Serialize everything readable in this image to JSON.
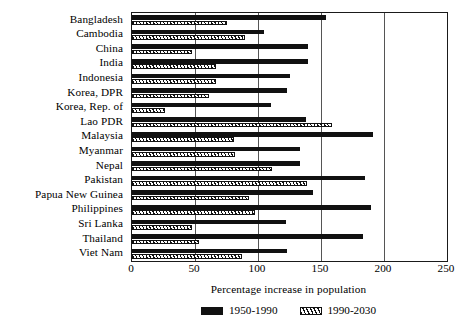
{
  "chart_data": {
    "type": "bar",
    "orientation": "horizontal",
    "title": "",
    "xlabel": "Percentage increase in population",
    "ylabel": "",
    "xlim": [
      0,
      250
    ],
    "xticks": [
      0,
      50,
      100,
      150,
      200,
      250
    ],
    "grid": true,
    "legend_position": "bottom",
    "categories": [
      "Bangladesh",
      "Cambodia",
      "China",
      "India",
      "Indonesia",
      "Korea, DPR",
      "Korea, Rep. of",
      "Lao PDR",
      "Malaysia",
      "Myanmar",
      "Nepal",
      "Pakistan",
      "Papua New Guinea",
      "Philippines",
      "Sri Lanka",
      "Thailand",
      "Viet Nam"
    ],
    "series": [
      {
        "name": "1950-1990",
        "style": "solid-black",
        "color": "#111111",
        "values": [
          154,
          105,
          140,
          140,
          125,
          123,
          110,
          138,
          191,
          133,
          133,
          185,
          144,
          190,
          122,
          183,
          123
        ]
      },
      {
        "name": "1990-2030",
        "style": "hatched",
        "color": "#111111",
        "values": [
          75,
          90,
          48,
          67,
          67,
          61,
          26,
          159,
          81,
          82,
          111,
          139,
          93,
          98,
          48,
          53,
          87
        ]
      }
    ]
  },
  "axis": {
    "tick_labels": [
      "0",
      "50",
      "100",
      "150",
      "200",
      "250"
    ],
    "title": "Percentage increase in population"
  },
  "legend": {
    "items": [
      {
        "label": "1950-1990",
        "swatch": "solid-black-swatch"
      },
      {
        "label": "1990-2030",
        "swatch": "hatched-swatch"
      }
    ]
  }
}
